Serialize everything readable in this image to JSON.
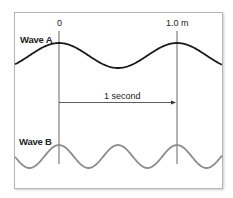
{
  "diagram": {
    "markers": {
      "start_label": "0",
      "end_label": "1.0 m"
    },
    "waves": [
      {
        "name": "Wave A",
        "color": "#1a1a1a",
        "wavelength_m": 1.0,
        "frequency_hz": 1
      },
      {
        "name": "Wave B",
        "color": "#8c8c8c",
        "wavelength_m": 0.5,
        "frequency_hz": 2
      }
    ],
    "interval_label": "1 second"
  }
}
